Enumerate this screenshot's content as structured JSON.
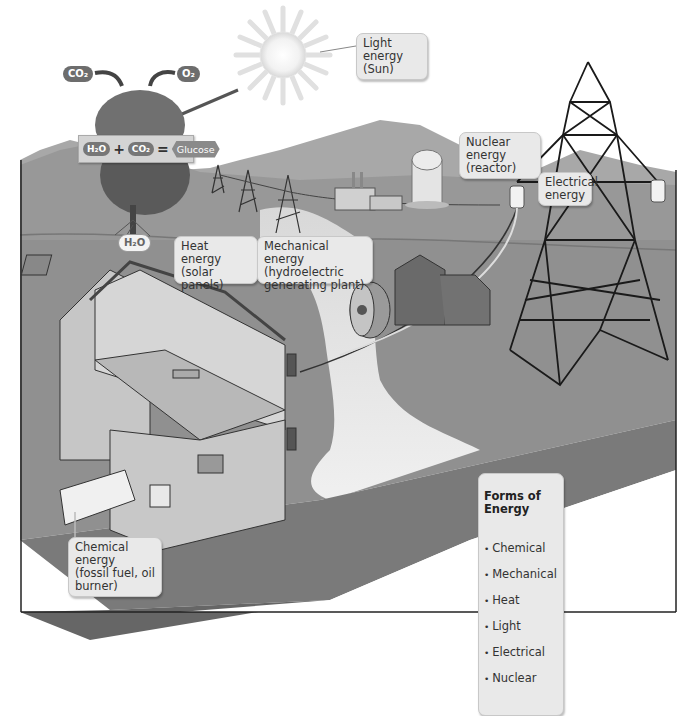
{
  "figure": {
    "type": "illustration"
  },
  "molecules": {
    "co2_top": "CO₂",
    "o2_top": "O₂",
    "h2o_root": "H₂O"
  },
  "equation": {
    "reactant_1": "H₂O",
    "operator_plus": "+",
    "reactant_2": "CO₂",
    "operator_equals": "=",
    "product": "Glucose"
  },
  "callouts": {
    "light": "Light energy\n(Sun)",
    "nuclear": "Nuclear energy\n(reactor)",
    "electrical": "Electrical\nenergy",
    "heat": "Heat energy\n(solar panels)",
    "mechanical": "Mechanical energy\n(hydroelectric\ngenerating plant)",
    "chemical": "Chemical energy\n(fossil fuel, oil\nburner)"
  },
  "legend": {
    "title": "Forms of Energy",
    "items": [
      "Chemical",
      "Mechanical",
      "Heat",
      "Light",
      "Electrical",
      "Nuclear"
    ]
  },
  "colors": {
    "ground_top": "#9a9a9a",
    "ground_front": "#7e7e7e",
    "mountains": "#a8a8a8",
    "water": "#e2e2e2",
    "callout_bg": "#e9e9e9"
  }
}
